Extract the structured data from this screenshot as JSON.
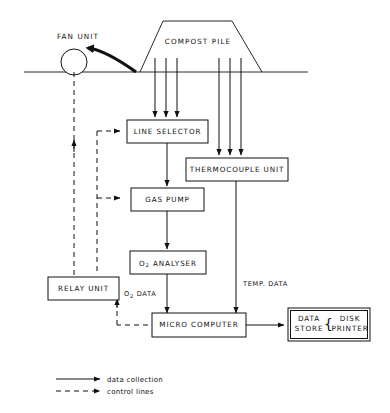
{
  "figure": {
    "background_color": "#ffffff",
    "line_color": "#111111"
  },
  "scene": {
    "fan_unit_label": "FAN UNIT",
    "compost_pile_label": "COMPOST PILE",
    "ground_line": true,
    "gas_probe_count": 3,
    "temp_probe_count": 3
  },
  "boxes": {
    "line_selector": {
      "label": "LINE SELECTOR"
    },
    "thermocouple_unit": {
      "label": "THERMOCOUPLE UNIT"
    },
    "gas_pump": {
      "label": "GAS PUMP"
    },
    "o2_analyser": {
      "label_main": "O",
      "label_sub": "2",
      "label_rest": " ANALYSER"
    },
    "relay_unit": {
      "label": "RELAY UNIT"
    },
    "micro_computer": {
      "label": "MICRO COMPUTER"
    },
    "data_store": {
      "label_line1": "DATA",
      "label_line2": "STORE",
      "brace": "{",
      "label_line3": "DISK",
      "label_line4": "PRINTER"
    }
  },
  "edge_labels": {
    "o2_data_main": "O",
    "o2_data_sub": "2",
    "o2_data_rest": " DATA",
    "temp_data": "TEMP. DATA"
  },
  "legend": {
    "items": [
      {
        "style": "solid",
        "label": "data collection"
      },
      {
        "style": "dashed",
        "label": "control lines"
      }
    ]
  }
}
